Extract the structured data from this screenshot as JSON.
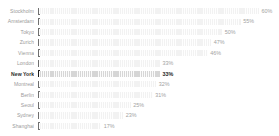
{
  "chart_data": {
    "type": "bar",
    "orientation": "horizontal",
    "title": "",
    "xlabel": "",
    "ylabel": "",
    "xlim": [
      0,
      60
    ],
    "grid": false,
    "legend": false,
    "value_suffix": "%",
    "categories": [
      "Stockholm",
      "Amsterdam",
      "Tokyo",
      "Zurich",
      "Vienna",
      "London",
      "New York",
      "Montreal",
      "Berlin",
      "Seoul",
      "Sydney",
      "Shanghai"
    ],
    "values": [
      60,
      55,
      50,
      47,
      46,
      33,
      33,
      32,
      31,
      25,
      23,
      17
    ],
    "labels": [
      "60%",
      "55%",
      "50%",
      "47%",
      "46%",
      "33%",
      "33%",
      "32%",
      "31%",
      "25%",
      "23%",
      "17%"
    ],
    "highlighted_category": "New York",
    "colors": {
      "bar": "#f2f2f2",
      "bar_highlight": "#d6d6d6",
      "marker": "#6f6f6f",
      "marker_highlight": "#1d1d1d",
      "label": "#9b9b9b",
      "label_highlight": "#2b2b2b",
      "value": "#a2a2a2",
      "value_highlight": "#1d1d1d",
      "background": "#ffffff"
    }
  }
}
